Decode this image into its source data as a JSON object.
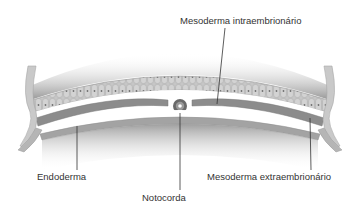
{
  "figure": {
    "title": "",
    "labels": {
      "mesoderma_intra": "Mesoderma intraembrionário",
      "endoderma": "Endoderma",
      "notocorda": "Notocorda",
      "mesoderma_extra": "Mesoderma extraembrionário"
    },
    "colors": {
      "ectoderm_band": "#a9a9a9",
      "ectoderm_cells": "#c4c4c4",
      "cell_nuclei": "#7a7a7a",
      "mesoderm": "#8c8c8c",
      "endoderm": "#9a9a9a",
      "shadow_gradient_dark": "#8a8a8a",
      "leader_line": "#333333",
      "background": "#ffffff"
    }
  }
}
